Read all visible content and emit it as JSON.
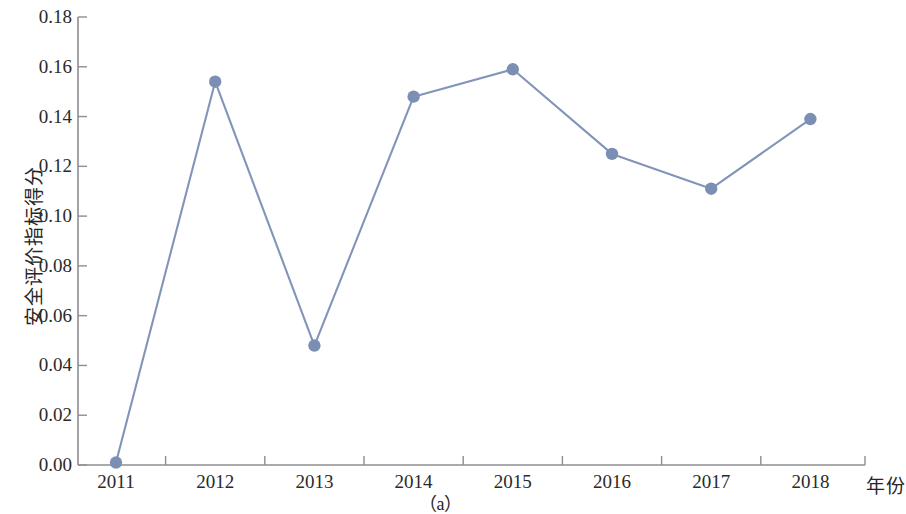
{
  "chart_data": {
    "type": "line",
    "title": "",
    "subtitle": "",
    "caption": "（a）",
    "xlabel": "年份",
    "ylabel": "安全评价指标得分",
    "categories": [
      "2011",
      "2012",
      "2013",
      "2014",
      "2015",
      "2016",
      "2017",
      "2018"
    ],
    "x": [
      2011,
      2012,
      2013,
      2014,
      2015,
      2016,
      2017,
      2018
    ],
    "values": [
      0.001,
      0.154,
      0.048,
      0.148,
      0.159,
      0.125,
      0.111,
      0.139
    ],
    "series": [
      {
        "name": "安全评价指标得分",
        "values": [
          0.001,
          0.154,
          0.048,
          0.148,
          0.159,
          0.125,
          0.111,
          0.139
        ]
      }
    ],
    "ylim": [
      0.0,
      0.18
    ],
    "xlim": [
      2010.6,
      2018.6
    ],
    "ytick_labels": [
      "0.00",
      "0.02",
      "0.04",
      "0.06",
      "0.08",
      "0.10",
      "0.12",
      "0.14",
      "0.16",
      "0.18"
    ],
    "ytick_values": [
      0.0,
      0.02,
      0.04,
      0.06,
      0.08,
      0.1,
      0.12,
      0.14,
      0.16,
      0.18
    ],
    "xtick_labels": [
      "2011",
      "2012",
      "2013",
      "2014",
      "2015",
      "2016",
      "2017",
      "2018"
    ],
    "grid": false,
    "legend": "none",
    "marker": "circle",
    "line_color": "#8295b8",
    "marker_color": "#7b8fb4",
    "axis_color": "#8e8e93"
  },
  "axes": {
    "y_label": "安全评价指标得分",
    "x_label": "年份"
  },
  "caption": {
    "text": "（a）"
  }
}
